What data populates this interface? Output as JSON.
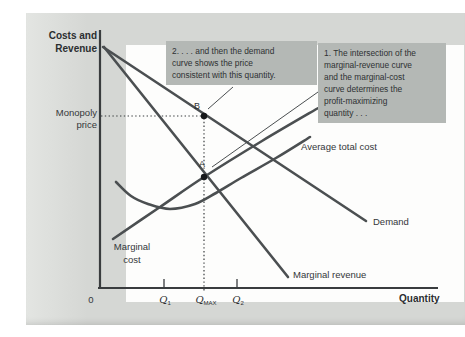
{
  "palette": {
    "page_bg": "#d5d7d4",
    "page_gutter": "#e3e5e2",
    "plot_bg": "#fdfdfc",
    "callout_bg": "#b4b8b5",
    "curve": "#4b4f51",
    "axis": "#393c3e",
    "dot": "#17191b",
    "text": "#2e3133"
  },
  "figure": {
    "y_axis_label": {
      "line1": "Costs and",
      "line2": "Revenue"
    },
    "x_axis_label": "Quantity",
    "origin_label": "0",
    "price_label": {
      "line1": "Monopoly",
      "line2": "price"
    },
    "points": {
      "a": "A",
      "b": "B"
    },
    "ticks": {
      "q1": {
        "base": "Q",
        "sub": "1"
      },
      "qmax": {
        "base": "Q",
        "sub": "MAX"
      },
      "q2": {
        "base": "Q",
        "sub": "2"
      }
    },
    "curve_labels": {
      "marginal_cost_line1": "Marginal",
      "marginal_cost_line2": "cost",
      "average_total_cost": "Average total cost",
      "demand": "Demand",
      "marginal_revenue": "Marginal revenue"
    },
    "callout_1": {
      "lines": [
        "1. The intersection of the",
        "marginal-revenue curve",
        "and the marginal-cost",
        "curve determines the",
        "profit-maximizing",
        "quantity . . ."
      ]
    },
    "callout_2": {
      "lines": [
        "2. . . . and then the demand",
        "curve shows the price",
        "consistent with this quantity."
      ]
    }
  },
  "chart_data": {
    "type": "line",
    "xlabel": "Quantity",
    "ylabel": "Costs and Revenue",
    "x_tick_labels": [
      "0",
      "Q1",
      "QMAX",
      "Q2"
    ],
    "y_tick_labels": [
      "Monopoly price"
    ],
    "legend_position": "labels-on-curves",
    "grid": false,
    "coordinate_space": "screen pixels of 465x337 image, y increases downward",
    "key_points": [
      {
        "label": "A",
        "px": [
          204,
          177
        ],
        "at_x_tick": "QMAX"
      },
      {
        "label": "B",
        "px": [
          204,
          116
        ],
        "at_x_tick": "QMAX",
        "at_y_tick": "Monopoly price"
      }
    ],
    "geometry": {
      "axes": [
        {
          "name": "y-axis",
          "x1": 100,
          "y1": 30,
          "x2": 100,
          "y2": 289,
          "w": 2.2
        },
        {
          "name": "x-axis",
          "x1": 98,
          "y1": 288,
          "x2": 438,
          "y2": 288,
          "w": 2.2
        }
      ],
      "series": [
        {
          "name": "demand-curve",
          "w": 2.6,
          "points": [
            [
              103,
              47
            ],
            [
              366,
              221
            ]
          ]
        },
        {
          "name": "marginal-revenue-curve",
          "w": 2.6,
          "points": [
            [
              104,
              47
            ],
            [
              288,
              277
            ]
          ]
        },
        {
          "name": "marginal-cost-curve",
          "w": 2.6,
          "points": [
            [
              113,
              239
            ],
            [
              160,
              207
            ],
            [
              204,
              177
            ],
            [
              262,
              141
            ],
            [
              320,
              107
            ]
          ]
        },
        {
          "name": "average-total-cost-curve",
          "w": 2.6,
          "points": [
            [
              116,
              182
            ],
            [
              131,
              196
            ],
            [
              148,
              204
            ],
            [
              170,
              209
            ],
            [
              195,
              204
            ],
            [
              216,
              193
            ],
            [
              241,
              178
            ],
            [
              276,
              158
            ],
            [
              310,
              137
            ]
          ]
        }
      ],
      "pointer_lines": [
        {
          "name": "callout-1-pointer",
          "points": [
            [
              212,
              167
            ],
            [
              318,
              92
            ]
          ],
          "w": 1
        },
        {
          "name": "callout-2-pointer",
          "points": [
            [
              208,
              109
            ],
            [
              233,
              87
            ]
          ],
          "w": 1
        }
      ],
      "dotted_guides": [
        {
          "name": "price-guide",
          "x1": 101,
          "y1": 116,
          "x2": 202,
          "y2": 116
        },
        {
          "name": "quantity-guide",
          "x1": 204,
          "y1": 118,
          "x2": 204,
          "y2": 292
        }
      ],
      "x_ticks": [
        {
          "name": "q1-tick",
          "x": 164
        },
        {
          "name": "q2-tick",
          "x": 237
        }
      ],
      "dots": [
        {
          "name": "point-b-dot",
          "x": 204,
          "y": 116,
          "r": 3.2
        },
        {
          "name": "point-a-dot",
          "x": 204,
          "y": 177,
          "r": 3.2
        }
      ]
    }
  }
}
